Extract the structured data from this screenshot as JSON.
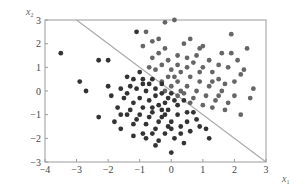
{
  "chart_data": {
    "type": "scatter",
    "title": "",
    "xlabel": "x1",
    "ylabel": "x2",
    "xlim": [
      -4,
      3
    ],
    "ylim": [
      -3,
      3
    ],
    "xticks": [
      "−4",
      "−3",
      "−2",
      "−1",
      "0",
      "1",
      "2",
      "3"
    ],
    "yticks": [
      "3",
      "2",
      "1",
      "0",
      "−1",
      "−2",
      "−3"
    ],
    "grid": false,
    "legend": null,
    "decision_boundary": {
      "description": "x1 + x2 = 0",
      "from": [
        -3,
        3
      ],
      "to": [
        3,
        -3
      ],
      "color": "#aaaaaa"
    },
    "series": [
      {
        "name": "class-1 (upper right)",
        "color": "#666666",
        "points": [
          [
            -0.2,
            2.9
          ],
          [
            0.1,
            3.0
          ],
          [
            1.9,
            2.4
          ],
          [
            0.9,
            1.8
          ],
          [
            1.6,
            1.6
          ],
          [
            1.9,
            1.6
          ],
          [
            2.1,
            1.3
          ],
          [
            2.3,
            0.9
          ],
          [
            2.2,
            0.7
          ],
          [
            2.0,
            0.4
          ],
          [
            1.5,
            0.5
          ],
          [
            1.3,
            0.8
          ],
          [
            1.5,
            1.1
          ],
          [
            1.0,
            1.0
          ],
          [
            0.7,
            1.2
          ],
          [
            0.5,
            1.4
          ],
          [
            0.2,
            1.5
          ],
          [
            -0.2,
            1.8
          ],
          [
            -0.4,
            2.2
          ],
          [
            -0.6,
            2.1
          ],
          [
            0.4,
            2.0
          ],
          [
            0.6,
            2.2
          ],
          [
            -0.6,
            1.4
          ],
          [
            -0.3,
            1.1
          ],
          [
            0.0,
            0.9
          ],
          [
            0.3,
            0.8
          ],
          [
            0.6,
            0.6
          ],
          [
            0.9,
            0.4
          ],
          [
            1.2,
            0.2
          ],
          [
            1.6,
            0.0
          ],
          [
            2.0,
            -0.2
          ],
          [
            2.5,
            -0.3
          ],
          [
            1.8,
            -0.5
          ],
          [
            1.4,
            -0.4
          ],
          [
            1.1,
            -0.2
          ],
          [
            0.8,
            0.0
          ],
          [
            0.5,
            0.2
          ],
          [
            0.2,
            0.4
          ],
          [
            -0.1,
            0.6
          ],
          [
            -0.3,
            0.4
          ],
          [
            0.0,
            0.2
          ],
          [
            0.4,
            -0.1
          ],
          [
            0.7,
            -0.3
          ],
          [
            1.0,
            -0.6
          ],
          [
            1.3,
            -0.7
          ],
          [
            1.7,
            -0.8
          ],
          [
            2.2,
            -1.0
          ],
          [
            -0.1,
            1.3
          ],
          [
            0.2,
            1.1
          ],
          [
            0.8,
            1.5
          ],
          [
            1.2,
            1.3
          ],
          [
            1.8,
            1.0
          ],
          [
            2.4,
            1.8
          ],
          [
            -0.5,
            0.9
          ],
          [
            -0.2,
            0.0
          ],
          [
            0.3,
            0.0
          ],
          [
            1.5,
            -0.2
          ],
          [
            0.6,
            -0.5
          ],
          [
            -0.8,
            2.5
          ],
          [
            -0.9,
            1.9
          ],
          [
            -0.7,
            1.0
          ],
          [
            0.1,
            0.6
          ],
          [
            0.9,
            0.8
          ],
          [
            1.3,
            0.4
          ],
          [
            2.6,
            0.1
          ],
          [
            1.0,
            1.9
          ],
          [
            -0.4,
            1.6
          ],
          [
            0.5,
            1.0
          ],
          [
            1.7,
            0.3
          ],
          [
            0.2,
            -0.2
          ]
        ]
      },
      {
        "name": "class-2 (lower left)",
        "color": "#333333",
        "points": [
          [
            -3.5,
            1.6
          ],
          [
            -2.3,
            1.3
          ],
          [
            -2.0,
            1.3
          ],
          [
            -1.1,
            2.5
          ],
          [
            -2.9,
            0.4
          ],
          [
            -2.7,
            0.0
          ],
          [
            -2.3,
            -1.1
          ],
          [
            -1.9,
            -0.2
          ],
          [
            -2.0,
            0.2
          ],
          [
            -1.6,
            0.1
          ],
          [
            -1.3,
            0.2
          ],
          [
            -1.2,
            0.5
          ],
          [
            -1.0,
            0.8
          ],
          [
            -0.9,
            0.5
          ],
          [
            -0.7,
            0.3
          ],
          [
            -0.5,
            0.1
          ],
          [
            -0.3,
            -0.1
          ],
          [
            -0.1,
            -0.3
          ],
          [
            0.2,
            -0.6
          ],
          [
            0.5,
            -0.9
          ],
          [
            0.8,
            -1.2
          ],
          [
            1.1,
            -1.6
          ],
          [
            1.2,
            -2.0
          ],
          [
            0.6,
            -1.7
          ],
          [
            0.3,
            -1.5
          ],
          [
            0.0,
            -1.3
          ],
          [
            -0.3,
            -1.1
          ],
          [
            -0.6,
            -0.9
          ],
          [
            -0.9,
            -0.7
          ],
          [
            -1.2,
            -0.5
          ],
          [
            -1.5,
            -0.3
          ],
          [
            -1.7,
            -0.7
          ],
          [
            -1.8,
            -1.3
          ],
          [
            -1.6,
            -1.6
          ],
          [
            -1.4,
            -1.0
          ],
          [
            -1.1,
            -1.2
          ],
          [
            -0.8,
            -1.4
          ],
          [
            -0.5,
            -1.6
          ],
          [
            -0.2,
            -1.8
          ],
          [
            0.1,
            -2.0
          ],
          [
            0.4,
            -2.2
          ],
          [
            0.0,
            -2.6
          ],
          [
            -0.4,
            -2.1
          ],
          [
            -0.6,
            -1.8
          ],
          [
            -0.9,
            -1.8
          ],
          [
            -1.2,
            -1.4
          ],
          [
            -0.7,
            -0.4
          ],
          [
            -0.4,
            -0.6
          ],
          [
            -0.1,
            -0.8
          ],
          [
            0.2,
            -1.0
          ],
          [
            0.5,
            -1.3
          ],
          [
            -0.2,
            -0.5
          ],
          [
            -0.5,
            -0.2
          ],
          [
            -0.8,
            0.0
          ],
          [
            -1.1,
            0.1
          ],
          [
            -1.4,
            -0.1
          ],
          [
            -0.6,
            0.5
          ],
          [
            -0.3,
            0.3
          ],
          [
            0.0,
            -0.1
          ],
          [
            -1.0,
            -0.3
          ],
          [
            -0.7,
            -1.1
          ],
          [
            -0.4,
            -1.3
          ],
          [
            -0.1,
            -1.5
          ],
          [
            0.3,
            -1.8
          ],
          [
            -1.3,
            -0.8
          ],
          [
            -1.6,
            -1.0
          ],
          [
            -0.9,
            0.3
          ],
          [
            -0.2,
            -1.0
          ],
          [
            0.4,
            -0.4
          ],
          [
            0.1,
            -0.4
          ],
          [
            -0.5,
            -2.3
          ],
          [
            -0.8,
            -2.0
          ],
          [
            -1.0,
            -1.0
          ],
          [
            0.7,
            -0.9
          ],
          [
            -1.4,
            0.6
          ],
          [
            -0.6,
            -0.7
          ],
          [
            -0.3,
            -0.8
          ],
          [
            0.0,
            -1.6
          ],
          [
            -1.2,
            -1.9
          ],
          [
            0.9,
            -1.5
          ]
        ]
      }
    ]
  }
}
